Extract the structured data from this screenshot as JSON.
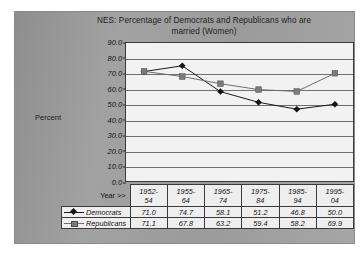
{
  "chart_data": {
    "type": "line",
    "title": "NES:  Percentage of Democrats and Republicans who are",
    "title_line2": "married (Women)",
    "title_full": "NES:  Percentage of Democrats and Republicans who are married (Women)",
    "xlabel": "Year >>",
    "ylabel": "Percent",
    "ylim": [
      0,
      90
    ],
    "ytick_step": 10,
    "ytick_labels": [
      "90.0",
      "80.0",
      "70.0",
      "60.0",
      "50.0",
      "40.0",
      "30.0",
      "20.0",
      "10.0",
      "0.0"
    ],
    "grid": "horizontal",
    "legend_position": "table-left",
    "categories": [
      "1952-54",
      "1955-64",
      "1965-74",
      "1975-84",
      "1985-94",
      "1995-04"
    ],
    "categories_wrapped": [
      {
        "top": "1952-",
        "bottom": "54"
      },
      {
        "top": "1955-",
        "bottom": "64"
      },
      {
        "top": "1965-",
        "bottom": "74"
      },
      {
        "top": "1975-",
        "bottom": "84"
      },
      {
        "top": "1985-",
        "bottom": "94"
      },
      {
        "top": "1995-",
        "bottom": "04"
      }
    ],
    "series": [
      {
        "name": "Democrats",
        "marker": "diamond",
        "color": "#151515",
        "values": [
          71.0,
          74.7,
          58.1,
          51.2,
          46.8,
          50.0
        ],
        "values_text": [
          "71.0",
          "74.7",
          "58.1",
          "51.2",
          "46.8",
          "50.0"
        ]
      },
      {
        "name": "Republicans",
        "marker": "square",
        "color": "#7b7b7b",
        "values": [
          71.1,
          67.8,
          63.2,
          59.4,
          58.2,
          69.9
        ],
        "values_text": [
          "71.1",
          "67.8",
          "63.2",
          "59.4",
          "58.2",
          "69.9"
        ]
      }
    ]
  },
  "colors": {
    "panel_background": "#9a9a9a",
    "plot_background": "#f2f2f2",
    "gridline": "#6f6f6f",
    "axis": "#3a3a3a",
    "democrats": "#151515",
    "republicans": "#7b7b7b"
  }
}
